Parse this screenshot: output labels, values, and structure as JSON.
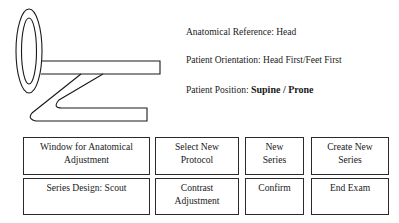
{
  "info": {
    "anatomical_reference": "Anatomical Reference: Head",
    "patient_orientation": "Patient Orientation: Head First/Feet First",
    "patient_position_label": "Patient Position: ",
    "patient_position_value": "Supine / Prone"
  },
  "buttons": {
    "window_adjustment": [
      "Window for Anatomical",
      "Adjustment"
    ],
    "select_new_protocol": [
      "Select New",
      "Protocol"
    ],
    "new_series": [
      "New",
      "Series"
    ],
    "create_new_series": [
      "Create New",
      "Series"
    ],
    "series_design": [
      "Series Design: Scout"
    ],
    "contrast_adjustment": [
      "Contrast",
      "Adjustment"
    ],
    "confirm": [
      "Confirm"
    ],
    "end_exam": [
      "End Exam"
    ]
  },
  "icons": {
    "gantry_patient": "gantry-with-patient-table-icon"
  }
}
